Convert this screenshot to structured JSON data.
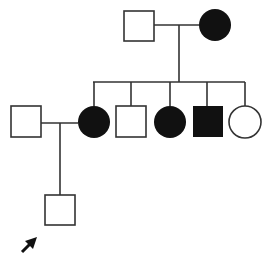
{
  "diagram": {
    "type": "pedigree",
    "colors": {
      "line": "#333333",
      "affected": "#111111",
      "unaffected": "#ffffff"
    },
    "individuals": [
      {
        "id": "I-1",
        "generation": 1,
        "sex": "male",
        "affected": false
      },
      {
        "id": "I-2",
        "generation": 1,
        "sex": "female",
        "affected": true
      },
      {
        "id": "II-1",
        "generation": 2,
        "sex": "male",
        "affected": false,
        "note": "married-in spouse of II-2"
      },
      {
        "id": "II-2",
        "generation": 2,
        "sex": "female",
        "affected": true
      },
      {
        "id": "II-3",
        "generation": 2,
        "sex": "male",
        "affected": false
      },
      {
        "id": "II-4",
        "generation": 2,
        "sex": "female",
        "affected": true
      },
      {
        "id": "II-5",
        "generation": 2,
        "sex": "male",
        "affected": true
      },
      {
        "id": "II-6",
        "generation": 2,
        "sex": "female",
        "affected": false
      },
      {
        "id": "III-1",
        "generation": 3,
        "sex": "male",
        "affected": false,
        "proband": true
      }
    ],
    "proband_marker": "arrow"
  }
}
